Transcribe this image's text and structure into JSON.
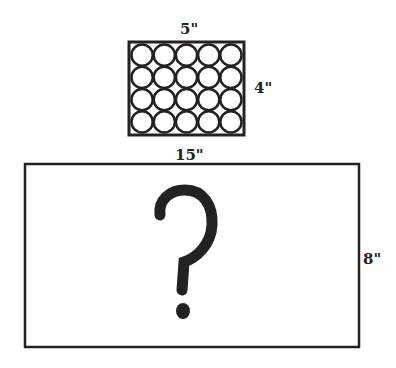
{
  "small_box": {
    "width_label": "5\"",
    "height_label": "4\"",
    "rows": 4,
    "cols": 5,
    "content": "20 circles"
  },
  "large_box": {
    "width_label": "15\"",
    "height_label": "8\"",
    "content_symbol": "?"
  },
  "colors": {
    "stroke": "#222222",
    "background": "#ffffff"
  }
}
